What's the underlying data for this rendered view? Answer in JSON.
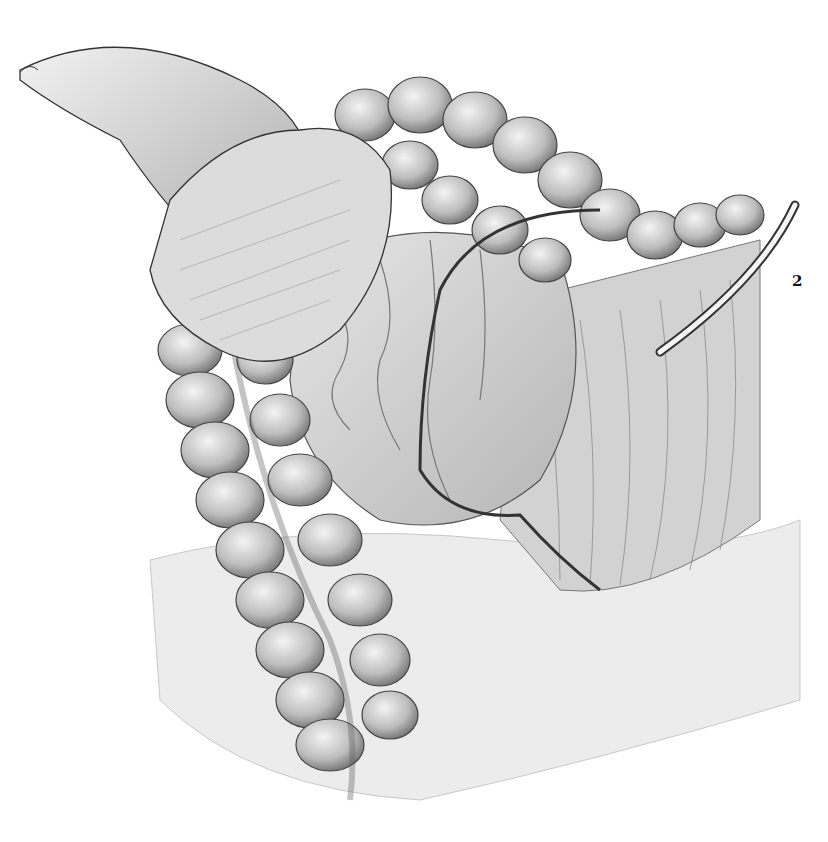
{
  "figure": {
    "labels": [
      {
        "text": "2",
        "x": 797,
        "y": 283
      }
    ]
  },
  "colors": {
    "background": "#ffffff",
    "ink": "#1a1a1a",
    "shade_mid": "#9a9a9a",
    "shade_light": "#d8d8d8"
  }
}
